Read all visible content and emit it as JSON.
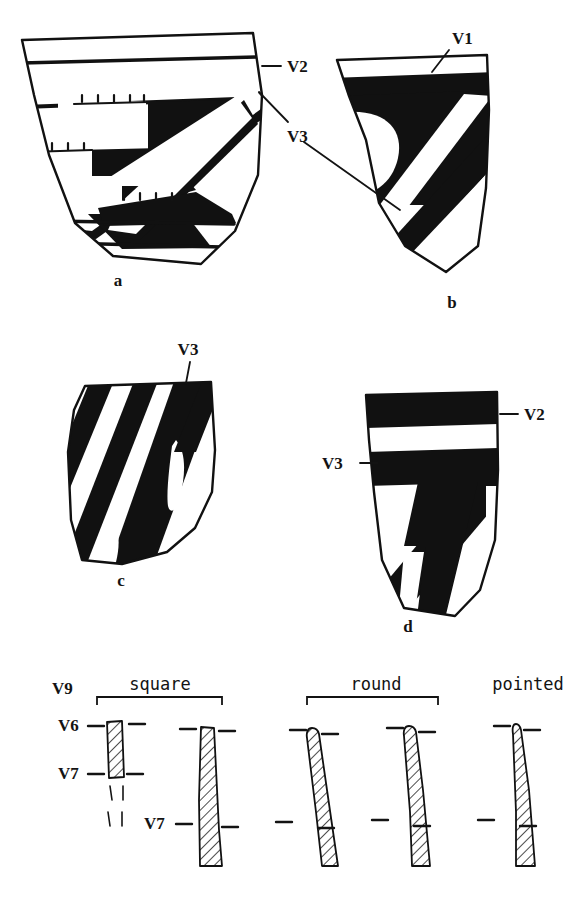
{
  "figure": {
    "kind": "archaeological-pottery-sherd-plate",
    "background_color": "#ffffff",
    "ink_color": "#111111",
    "panels": [
      {
        "id": "a",
        "caption": "a",
        "caption_x": 118,
        "caption_y": 286,
        "description": "Rim sherd with banded rim lines and bold diagonal painted zones with comb-ticked edges",
        "labels": [
          "V2",
          "V3"
        ]
      },
      {
        "id": "b",
        "caption": "b",
        "caption_x": 452,
        "caption_y": 308,
        "description": "Rim sherd with solid rim band and two bold diagonal stripes",
        "labels": [
          "V1",
          "V3"
        ]
      },
      {
        "id": "c",
        "caption": "c",
        "caption_x": 121,
        "caption_y": 586,
        "description": "Body sherd with four bold parallel diagonal stripes and hooked terminals",
        "labels": [
          "V3"
        ]
      },
      {
        "id": "d",
        "caption": "d",
        "caption_x": 408,
        "caption_y": 632,
        "description": "Rim sherd with two solid horizontal bands and a hooked chevron motif",
        "labels": [
          "V2",
          "V3"
        ]
      }
    ],
    "callouts": [
      {
        "id": "a-v2",
        "text": "V2",
        "x": 287,
        "y": 72,
        "panel": "a"
      },
      {
        "id": "a-b-v3",
        "text": "V3",
        "x": 287,
        "y": 136,
        "panel": "a,b"
      },
      {
        "id": "b-v1",
        "text": "V1",
        "x": 452,
        "y": 40,
        "panel": "b"
      },
      {
        "id": "c-v3",
        "text": "V3",
        "x": 188,
        "y": 352,
        "panel": "c"
      },
      {
        "id": "d-v2",
        "text": "V2",
        "x": 523,
        "y": 418,
        "panel": "d"
      },
      {
        "id": "d-v3",
        "text": "V3",
        "x": 337,
        "y": 464,
        "panel": "d"
      }
    ],
    "profile_row": {
      "title_labels": [
        {
          "id": "square",
          "text": "square",
          "x": 160,
          "y": 684,
          "bracket": {
            "x1": 97,
            "x2": 222,
            "y": 697,
            "tip": 8
          }
        },
        {
          "id": "round",
          "text": "round",
          "x": 384,
          "y": 684,
          "bracket": {
            "x1": 307,
            "x2": 438,
            "y": 697,
            "tip": 8
          }
        },
        {
          "id": "pointed",
          "text": "pointed",
          "x": 528,
          "y": 684,
          "bracket": null
        }
      ],
      "side_labels": [
        {
          "id": "v9",
          "text": "V9",
          "x": 62,
          "y": 689,
          "leader": null
        },
        {
          "id": "v6",
          "text": "V6",
          "x": 70,
          "y": 731,
          "leader": {
            "x1": 88,
            "y1": 726,
            "x2": 106,
            "y2": 726
          }
        },
        {
          "id": "v7-left",
          "text": "V7",
          "x": 70,
          "y": 777,
          "leader": {
            "x1": 88,
            "y1": 772,
            "x2": 106,
            "y2": 772
          }
        },
        {
          "id": "v7-mid",
          "text": "V7",
          "x": 162,
          "y": 828,
          "leader": {
            "x1": 182,
            "y1": 823,
            "x2": 200,
            "y2": 823
          }
        }
      ],
      "profiles": [
        {
          "id": "profile-square-short",
          "shape": "square",
          "hatched": true,
          "dashed_continuation": true
        },
        {
          "id": "profile-square-tall",
          "shape": "square",
          "hatched": true,
          "dashed_continuation": false
        },
        {
          "id": "profile-round-1",
          "shape": "round",
          "hatched": true,
          "dashed_continuation": false
        },
        {
          "id": "profile-round-2",
          "shape": "round",
          "hatched": true,
          "dashed_continuation": false
        },
        {
          "id": "profile-pointed",
          "shape": "pointed",
          "hatched": true,
          "dashed_continuation": false
        }
      ]
    }
  }
}
